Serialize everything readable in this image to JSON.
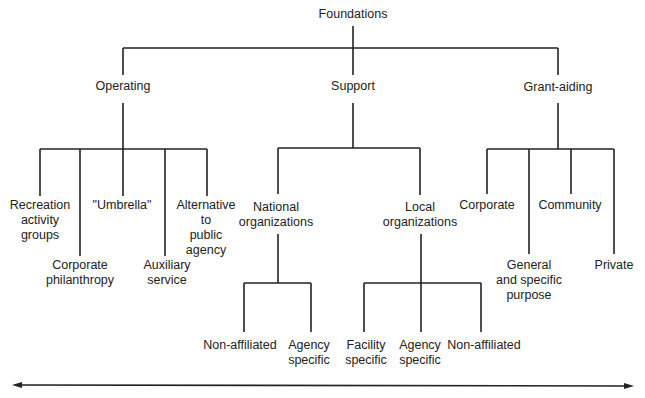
{
  "diagram": {
    "root": "Foundations",
    "level1": {
      "operating": "Operating",
      "support": "Support",
      "grant_aiding": "Grant-aiding"
    },
    "operating_children": {
      "recreation": "Recreation\nactivity\ngroups",
      "corporate_philanthropy": "Corporate\nphilanthropy",
      "umbrella": "\"Umbrella\"",
      "auxiliary": "Auxiliary\nservice",
      "alternative": "Alternative\nto\npublic\nagency"
    },
    "support_children": {
      "national": "National\norganizations",
      "local": "Local\norganizations"
    },
    "national_children": {
      "non_affiliated": "Non-affiliated",
      "agency_specific": "Agency\nspecific"
    },
    "local_children": {
      "facility_specific": "Facility\nspecific",
      "agency_specific": "Agency\nspecific",
      "non_affiliated": "Non-affiliated"
    },
    "grant_children": {
      "corporate": "Corporate",
      "general": "General\nand specific\npurpose",
      "community": "Community",
      "private": "Private"
    },
    "line_color": "#222222"
  }
}
